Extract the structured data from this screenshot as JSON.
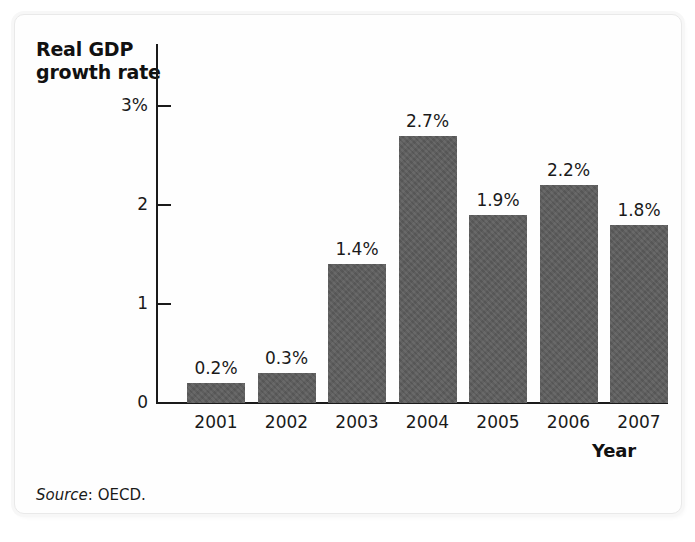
{
  "figure": {
    "y_axis_title": "Real GDP\ngrowth rate",
    "y_axis_title_line1": "Real GDP",
    "y_axis_title_line2": "growth rate",
    "x_axis_title": "Year",
    "source_label": "Source",
    "source_text": ": OECD."
  },
  "chart_data": {
    "type": "bar",
    "title": "",
    "xlabel": "Year",
    "ylabel": "Real GDP growth rate",
    "categories": [
      "2001",
      "2002",
      "2003",
      "2004",
      "2005",
      "2006",
      "2007"
    ],
    "values": [
      0.2,
      0.3,
      1.4,
      2.7,
      1.9,
      2.2,
      1.8
    ],
    "value_labels": [
      "0.2%",
      "0.3%",
      "1.4%",
      "2.7%",
      "1.9%",
      "2.2%",
      "1.8%"
    ],
    "ylim": [
      0,
      3
    ],
    "yticks": [
      0,
      1,
      2,
      3
    ],
    "ytick_labels": [
      "0",
      "1",
      "2",
      "3%"
    ],
    "grid": false,
    "legend": null,
    "series": [
      {
        "name": "Real GDP growth rate",
        "values": [
          0.2,
          0.3,
          1.4,
          2.7,
          1.9,
          2.2,
          1.8
        ]
      }
    ],
    "bar_color": "#5d5d5d",
    "axis_color": "#1a1a1a",
    "background_color": "#ffffff"
  }
}
